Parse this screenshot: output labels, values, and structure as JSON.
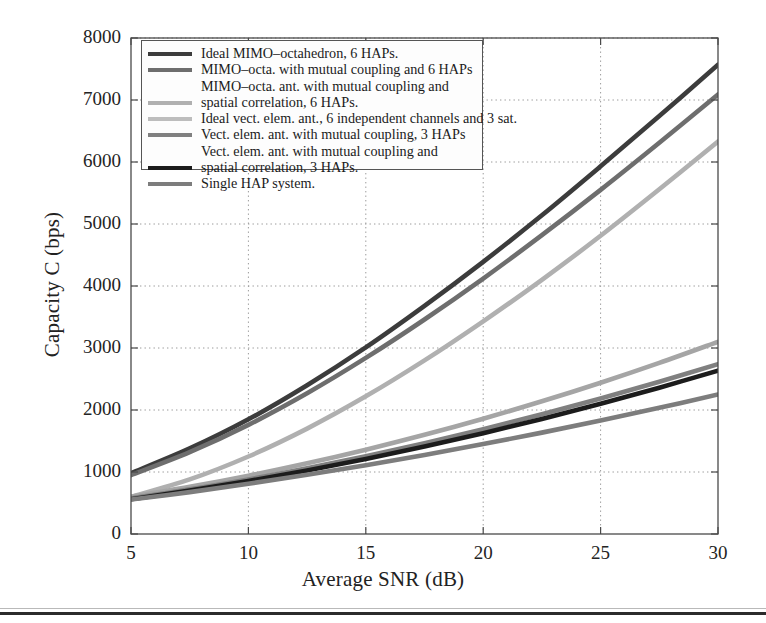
{
  "chart_data": {
    "type": "line",
    "title": "",
    "xlabel": "Average SNR (dB)",
    "ylabel": "Capacity C (bps)",
    "xlim": [
      5,
      30
    ],
    "ylim": [
      0,
      8000
    ],
    "xticks": [
      5,
      10,
      15,
      20,
      25,
      30
    ],
    "yticks": [
      0,
      1000,
      2000,
      3000,
      4000,
      5000,
      6000,
      7000,
      8000
    ],
    "xtick_labels": [
      "5",
      "10",
      "15",
      "20",
      "25",
      "30"
    ],
    "ytick_labels": [
      "0",
      "1000",
      "2000",
      "3000",
      "4000",
      "5000",
      "6000",
      "7000",
      "8000"
    ],
    "grid": true,
    "grid_style": "dotted",
    "legend_position": "upper left",
    "x": [
      5,
      7.5,
      10,
      12.5,
      15,
      17.5,
      20,
      22.5,
      25,
      27.5,
      30
    ],
    "series": [
      {
        "name": "Ideal MIMO-octahedron, 6 HAPs.",
        "color": "#3c3c3c",
        "values": [
          980,
          1380,
          1850,
          2400,
          3010,
          3680,
          4390,
          5140,
          5930,
          6740,
          7570
        ],
        "clipped_at_top_x": 24.8
      },
      {
        "name": "MIMO-octa. with mutual coupling and 6 HAPs",
        "color": "#6e6e6e",
        "values": [
          950,
          1320,
          1760,
          2270,
          2840,
          3460,
          4120,
          4820,
          5550,
          6310,
          7090
        ],
        "clipped_at_top_x": 27.3
      },
      {
        "name": "MIMO-octa. ant. with mutual coupling and spatial correlation, 6 HAPs.",
        "color": "#b0b0b0",
        "values": [
          600,
          880,
          1250,
          1700,
          2220,
          2800,
          3430,
          4100,
          4810,
          5560,
          6330
        ],
        "clipped_at_top_x": 28.6
      },
      {
        "name": "Ideal vect. elem. ant., 6 independent channels and 3 sat.",
        "color": "#a5a5a5",
        "values": [
          600,
          760,
          940,
          1140,
          1360,
          1600,
          1860,
          2140,
          2440,
          2760,
          3100
        ],
        "clipped_at_top_x": null
      },
      {
        "name": "Vect. elem. ant. with mutual coupling, 3 HAPs",
        "color": "#808080",
        "values": [
          575,
          720,
          880,
          1060,
          1255,
          1465,
          1690,
          1930,
          2185,
          2455,
          2740
        ],
        "clipped_at_top_x": null
      },
      {
        "name": "Vect. elem. ant. with mutual coupling and spatial correlation, 3 HAPs.",
        "color": "#1c1c1c",
        "values": [
          560,
          700,
          855,
          1025,
          1210,
          1410,
          1625,
          1855,
          2100,
          2360,
          2635
        ],
        "clipped_at_top_x": null
      },
      {
        "name": "Single HAP system.",
        "color": "#7d7d7d",
        "values": [
          555,
          675,
          810,
          955,
          1110,
          1275,
          1450,
          1635,
          1830,
          2035,
          2250
        ],
        "clipped_at_top_x": null
      }
    ]
  },
  "legend": {
    "lines": [
      "Ideal MIMO–octahedron, 6 HAPs.",
      "MIMO–octa. with mutual coupling and 6 HAPs",
      "MIMO–octa. ant. with mutual coupling and",
      "spatial correlation, 6 HAPs.",
      "Ideal vect. elem. ant., 6 independent channels and 3 sat.",
      "Vect. elem.  ant. with mutual coupling, 3 HAPs",
      "Vect. elem. ant. with mutual coupling and",
      "spatial correlation, 3 HAPs.",
      "Single HAP system."
    ],
    "swatch_rows": [
      {
        "slot": 0,
        "color": "#3c3c3c"
      },
      {
        "slot": 1,
        "color": "#6e6e6e"
      },
      {
        "slot": 2,
        "color": "transparent"
      },
      {
        "slot": 3,
        "color": "#b0b0b0"
      },
      {
        "slot": 4,
        "color": "#bdbdbd"
      },
      {
        "slot": 5,
        "color": "#808080"
      },
      {
        "slot": 6,
        "color": "transparent"
      },
      {
        "slot": 7,
        "color": "#1c1c1c"
      },
      {
        "slot": 8,
        "color": "#7d7d7d"
      }
    ]
  },
  "colors": {
    "axis": "#4a4a4a",
    "grid": "#9a9a9a",
    "background": "#ffffff",
    "text": "#1a1a1a"
  }
}
